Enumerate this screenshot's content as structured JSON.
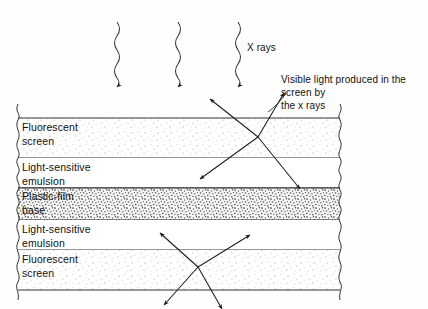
{
  "figure": {
    "background_color": "#fefefe",
    "line_color": "#222222"
  },
  "layers": [
    {
      "id": "fluorescent-screen-top",
      "label": "Fluorescent\nscreen",
      "texture": "fine-stipple",
      "y": 118,
      "height": 40
    },
    {
      "id": "light-sensitive-emulsion-top",
      "label": "Light-sensitive\nemulsion",
      "texture": "none",
      "y": 158,
      "height": 30
    },
    {
      "id": "plastic-film-base",
      "label": "Plastic-film\nbase",
      "texture": "dense-speckle",
      "y": 188,
      "height": 32
    },
    {
      "id": "light-sensitive-emulsion-bottom",
      "label": "Light-sensitive\nemulsion",
      "texture": "none",
      "y": 220,
      "height": 30
    },
    {
      "id": "fluorescent-screen-bottom",
      "label": "Fluorescent\nscreen",
      "texture": "fine-stipple",
      "y": 250,
      "height": 40
    }
  ],
  "annotations": {
    "xray_label": "X rays",
    "visible_light_caption": "Visible light produced in the\nscreen by\nthe x rays"
  },
  "xray_beams": [
    {
      "id": "xray-beam-1",
      "x": 117,
      "y_start": 22,
      "y_end": 82
    },
    {
      "id": "xray-beam-2",
      "x": 178,
      "y_start": 22,
      "y_end": 82
    },
    {
      "id": "xray-beam-3",
      "x": 238,
      "y_start": 22,
      "y_end": 82
    }
  ],
  "light_bursts": [
    {
      "id": "light-burst-top",
      "center_x": 258,
      "center_y": 137,
      "rays": [
        {
          "dx": -48,
          "dy": -38
        },
        {
          "dx": 26,
          "dy": -44
        },
        {
          "dx": -58,
          "dy": 42
        },
        {
          "dx": 42,
          "dy": 52
        }
      ]
    },
    {
      "id": "light-burst-bottom",
      "center_x": 198,
      "center_y": 267,
      "rays": [
        {
          "dx": -38,
          "dy": -34
        },
        {
          "dx": 52,
          "dy": -32
        },
        {
          "dx": -34,
          "dy": 38
        },
        {
          "dx": 24,
          "dy": 42
        }
      ]
    }
  ]
}
